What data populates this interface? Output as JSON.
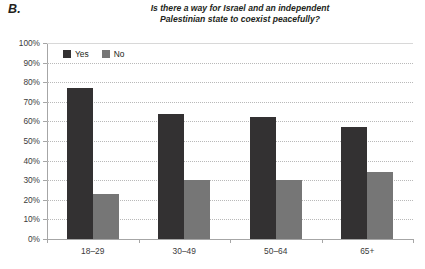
{
  "panel": {
    "label": "B."
  },
  "chart_data": {
    "type": "bar",
    "title": "Is there a way for Israel and an independent Palestinian state to coexist peacefully?",
    "title_line1": "Is there a way for Israel and an independent",
    "title_line2": "Palestinian state to coexist peacefully?",
    "xlabel": "",
    "ylabel": "",
    "ylim": [
      0,
      100
    ],
    "ytick_step": 10,
    "grid": true,
    "legend_position": "top-left-inside",
    "categories": [
      "18–29",
      "30–49",
      "50–64",
      "65+"
    ],
    "ytick_labels": [
      "0%",
      "10%",
      "20%",
      "30%",
      "40%",
      "50%",
      "60%",
      "70%",
      "80%",
      "90%",
      "100%"
    ],
    "series": [
      {
        "name": "Yes",
        "color": "#333132",
        "values": [
          77,
          64,
          62,
          57
        ]
      },
      {
        "name": "No",
        "color": "#767676",
        "values": [
          23,
          30,
          30,
          34
        ]
      }
    ]
  }
}
